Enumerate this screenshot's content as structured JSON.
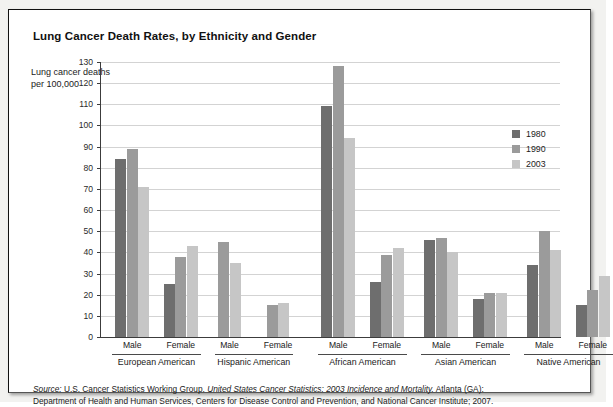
{
  "figure": {
    "title": "Lung Cancer Death Rates, by Ethnicity and Gender",
    "y_axis_caption": "Lung cancer deaths per 100,000",
    "source_line1_pre": "Source:",
    "source_line1_plain": " U.S. Cancer Statistics Working Group. ",
    "source_line1_italic": "United States Cancer Statistics: 2003 Incidence and Mortality.",
    "source_line1_post": " Atlanta (GA):",
    "source_line2": "Department of Health and Human Services, Centers for Disease Control and Prevention, and National Cancer Institute; 2007."
  },
  "colors": {
    "year_1980": "#6e6e6e",
    "year_1990": "#9b9b9b",
    "year_2003": "#c6c6c6",
    "gridline": "#d3d3d3",
    "axis": "#3c3c3c"
  },
  "legend": {
    "position": "right-inside",
    "entries": [
      {
        "label": "1980",
        "color": "#6e6e6e"
      },
      {
        "label": "1990",
        "color": "#9b9b9b"
      },
      {
        "label": "2003",
        "color": "#c6c6c6"
      }
    ]
  },
  "chart_data": {
    "type": "bar",
    "title": "Lung Cancer Death Rates, by Ethnicity and Gender",
    "xlabel": "",
    "ylabel": "Lung cancer deaths per 100,000",
    "ylim": [
      0,
      130
    ],
    "ytick_step": 10,
    "yticks": [
      0,
      10,
      20,
      30,
      40,
      50,
      60,
      70,
      80,
      90,
      100,
      110,
      120,
      130
    ],
    "grid": true,
    "series": [
      {
        "name": "1980",
        "color": "#6e6e6e"
      },
      {
        "name": "1990",
        "color": "#9b9b9b"
      },
      {
        "name": "2003",
        "color": "#c6c6c6"
      }
    ],
    "ethnicities": [
      "European American",
      "Hispanic American",
      "African American",
      "Asian American",
      "Native American"
    ],
    "genders": [
      "Male",
      "Female"
    ],
    "categories": [
      "European American Male",
      "European American Female",
      "Hispanic American Male",
      "Hispanic American Female",
      "African American Male",
      "African American Female",
      "Asian American Male",
      "Asian American Female",
      "Native American Male",
      "Native American Female"
    ],
    "groups": [
      {
        "ethnicity": "European American",
        "gender": "Male",
        "values": {
          "1980": 84,
          "1990": 89,
          "2003": 71
        }
      },
      {
        "ethnicity": "European American",
        "gender": "Female",
        "values": {
          "1980": 25,
          "1990": 38,
          "2003": 43
        }
      },
      {
        "ethnicity": "Hispanic American",
        "gender": "Male",
        "values": {
          "1980": null,
          "1990": 45,
          "2003": 35
        }
      },
      {
        "ethnicity": "Hispanic American",
        "gender": "Female",
        "values": {
          "1980": null,
          "1990": 15,
          "2003": 16
        }
      },
      {
        "ethnicity": "African American",
        "gender": "Male",
        "values": {
          "1980": 109,
          "1990": 128,
          "2003": 94
        }
      },
      {
        "ethnicity": "African American",
        "gender": "Female",
        "values": {
          "1980": 26,
          "1990": 39,
          "2003": 42
        }
      },
      {
        "ethnicity": "Asian American",
        "gender": "Male",
        "values": {
          "1980": 46,
          "1990": 47,
          "2003": 40
        }
      },
      {
        "ethnicity": "Asian American",
        "gender": "Female",
        "values": {
          "1980": 18,
          "1990": 21,
          "2003": 21
        }
      },
      {
        "ethnicity": "Native American",
        "gender": "Male",
        "values": {
          "1980": 34,
          "1990": 50,
          "2003": 41
        }
      },
      {
        "ethnicity": "Native American",
        "gender": "Female",
        "values": {
          "1980": 15,
          "1990": 22,
          "2003": 29
        }
      }
    ]
  }
}
